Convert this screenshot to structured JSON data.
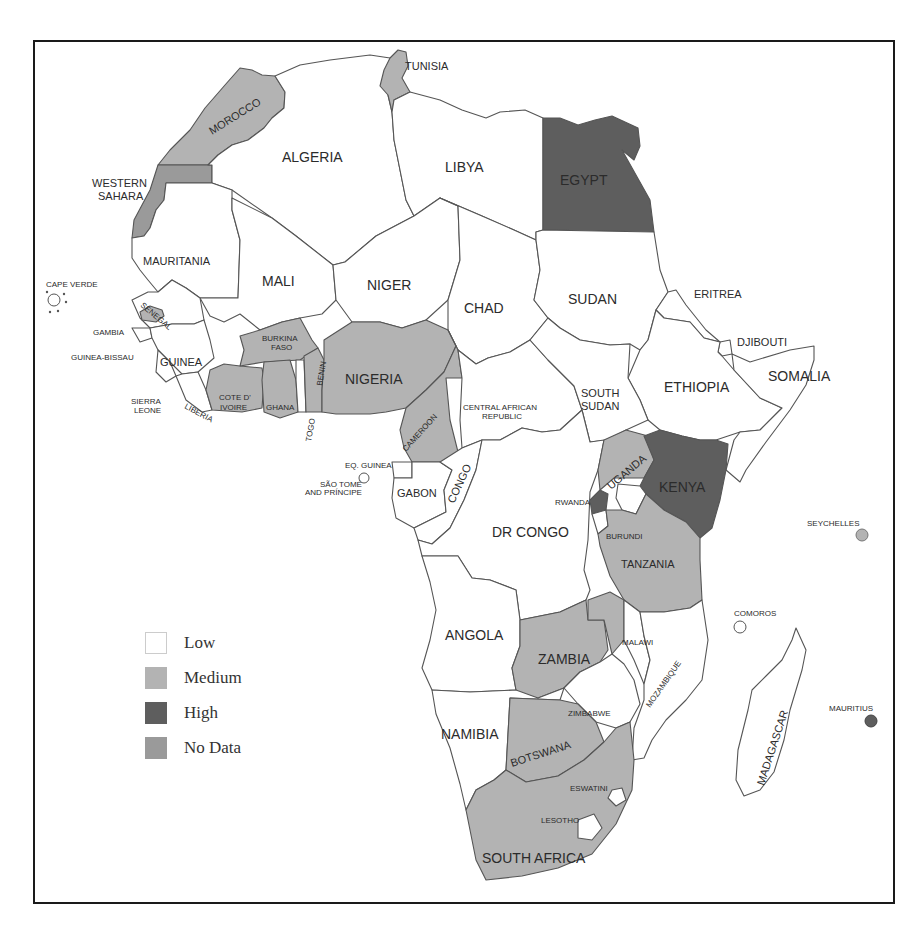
{
  "page": {
    "number_cut_off": ""
  },
  "colors": {
    "low": "#ffffff",
    "medium": "#b3b3b3",
    "high": "#5e5e5e",
    "no_data": "#9a9a9a",
    "border": "#555555",
    "frame": "#1a1a1a"
  },
  "legend": {
    "items": [
      {
        "key": "low",
        "label": "Low",
        "color": "#ffffff"
      },
      {
        "key": "medium",
        "label": "Medium",
        "color": "#b3b3b3"
      },
      {
        "key": "high",
        "label": "High",
        "color": "#5e5e5e"
      },
      {
        "key": "no_data",
        "label": "No Data",
        "color": "#9a9a9a"
      }
    ]
  },
  "map": {
    "title": "",
    "region": "Africa",
    "countries": {
      "morocco": {
        "label": "MOROCCO",
        "category": "medium"
      },
      "western_sahara": {
        "label": "WESTERN SAHARA",
        "label_line1": "WESTERN",
        "label_line2": "SAHARA",
        "category": "no_data"
      },
      "algeria": {
        "label": "ALGERIA",
        "category": "low"
      },
      "tunisia": {
        "label": "TUNISIA",
        "category": "medium"
      },
      "libya": {
        "label": "LIBYA",
        "category": "low"
      },
      "egypt": {
        "label": "EGYPT",
        "category": "high"
      },
      "mauritania": {
        "label": "MAURITANIA",
        "category": "low"
      },
      "mali": {
        "label": "MALI",
        "category": "low"
      },
      "niger": {
        "label": "NIGER",
        "category": "low"
      },
      "chad": {
        "label": "CHAD",
        "category": "low"
      },
      "sudan": {
        "label": "SUDAN",
        "category": "low"
      },
      "eritrea": {
        "label": "ERITREA",
        "category": "low"
      },
      "djibouti": {
        "label": "DJIBOUTI",
        "category": "low"
      },
      "ethiopia": {
        "label": "ETHIOPIA",
        "category": "low"
      },
      "somalia": {
        "label": "SOMALIA",
        "category": "low"
      },
      "cape_verde": {
        "label": "CAPE VERDE",
        "category": "low"
      },
      "senegal": {
        "label": "SENEGAL",
        "category": "low"
      },
      "gambia": {
        "label": "GAMBIA",
        "category": "medium"
      },
      "guinea_bissau": {
        "label": "GUINEA-BISSAU",
        "category": "low"
      },
      "guinea": {
        "label": "GUINEA",
        "category": "low"
      },
      "sierra_leone": {
        "label": "SIERRA LEONE",
        "label_line1": "SIERRA",
        "label_line2": "LEONE",
        "category": "low"
      },
      "liberia": {
        "label": "LIBERIA",
        "category": "low"
      },
      "cote_divoire": {
        "label": "COTE D' IVOIRE",
        "label_line1": "COTE D'",
        "label_line2": "IVOIRE",
        "category": "medium"
      },
      "burkina_faso": {
        "label": "BURKINA FASO",
        "label_line1": "BURKINA",
        "label_line2": "FASO",
        "category": "medium"
      },
      "ghana": {
        "label": "GHANA",
        "category": "medium"
      },
      "togo": {
        "label": "TOGO",
        "category": "low"
      },
      "benin": {
        "label": "BENIN",
        "category": "medium"
      },
      "nigeria": {
        "label": "NIGERIA",
        "category": "medium"
      },
      "cameroon": {
        "label": "CAMEROON",
        "category": "medium"
      },
      "central_african_republic": {
        "label": "CENTRAL AFRICAN REPUBLIC",
        "label_line1": "CENTRAL AFRICAN",
        "label_line2": "REPUBLIC",
        "category": "low"
      },
      "south_sudan": {
        "label": "SOUTH SUDAN",
        "label_line1": "SOUTH",
        "label_line2": "SUDAN",
        "category": "low"
      },
      "eq_guinea": {
        "label": "EQ. GUINEA",
        "category": "low"
      },
      "sao_tome": {
        "label": "SÃO TOMÉ AND PRÍNCIPE",
        "label_line1": "SÃO TOMÉ",
        "label_line2": "AND PRÍNCIPE",
        "category": "low"
      },
      "gabon": {
        "label": "GABON",
        "category": "low"
      },
      "congo": {
        "label": "CONGO",
        "category": "low"
      },
      "dr_congo": {
        "label": "DR CONGO",
        "category": "low"
      },
      "uganda": {
        "label": "UGANDA",
        "category": "medium"
      },
      "kenya": {
        "label": "KENYA",
        "category": "high"
      },
      "rwanda": {
        "label": "RWANDA",
        "category": "high"
      },
      "burundi": {
        "label": "BURUNDI",
        "category": "low"
      },
      "tanzania": {
        "label": "TANZANIA",
        "category": "medium"
      },
      "seychelles": {
        "label": "SEYCHELLES",
        "category": "medium"
      },
      "comoros": {
        "label": "COMOROS",
        "category": "low"
      },
      "angola": {
        "label": "ANGOLA",
        "category": "low"
      },
      "zambia": {
        "label": "ZAMBIA",
        "category": "medium"
      },
      "malawi": {
        "label": "MALAWI",
        "category": "low"
      },
      "mozambique": {
        "label": "MOZAMBIQUE",
        "category": "low"
      },
      "madagascar": {
        "label": "MADAGASCAR",
        "category": "low"
      },
      "mauritius": {
        "label": "MAURITIUS",
        "category": "high"
      },
      "zimbabwe": {
        "label": "ZIMBABWE",
        "category": "low"
      },
      "namibia": {
        "label": "NAMIBIA",
        "category": "low"
      },
      "botswana": {
        "label": "BOTSWANA",
        "category": "medium"
      },
      "eswatini": {
        "label": "ESWATINI",
        "category": "low"
      },
      "lesotho": {
        "label": "LESOTHO",
        "category": "low"
      },
      "south_africa": {
        "label": "SOUTH AFRICA",
        "category": "medium"
      }
    }
  }
}
